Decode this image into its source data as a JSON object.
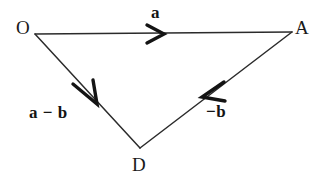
{
  "diagram": {
    "kind": "vector-triangle",
    "background_color": "#ffffff",
    "stroke_color": "#2b2b2b",
    "arrow_color": "#141414",
    "vertices": [
      {
        "id": "O",
        "label": "O",
        "x": 35,
        "y": 34
      },
      {
        "id": "A",
        "label": "A",
        "x": 292,
        "y": 32
      },
      {
        "id": "D",
        "label": "D",
        "x": 140,
        "y": 148
      }
    ],
    "edges": [
      {
        "id": "OA",
        "from": "O",
        "to": "A",
        "label": "a",
        "arrow_position": {
          "x": 155,
          "y": 33
        },
        "arrow_direction": "right"
      },
      {
        "id": "OD",
        "from": "O",
        "to": "D",
        "label": "a − b",
        "arrow_position": {
          "x": 95,
          "y": 100
        },
        "arrow_direction": "down-right"
      },
      {
        "id": "AD",
        "from": "A",
        "to": "D",
        "label": "−b",
        "arrow_position": {
          "x": 205,
          "y": 96
        },
        "arrow_direction": "down-left"
      }
    ],
    "labels": {
      "vertex_o": "O",
      "vertex_a": "A",
      "vertex_d": "D",
      "vector_a": "a",
      "vector_a_minus_b": "a − b",
      "vector_minus_b": "−b"
    }
  }
}
